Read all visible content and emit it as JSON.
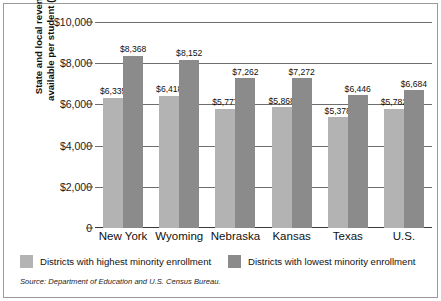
{
  "chart_data": {
    "type": "bar",
    "title": "",
    "xlabel": "",
    "ylabel": "State and local revenues available per student (2000)",
    "ylabel_line1": "State and local revenues",
    "ylabel_line2": "available per student (2000)",
    "ylim": [
      0,
      10000
    ],
    "ytick_labels": [
      "$10,000",
      "$8,000",
      "$6,000",
      "$4,000",
      "$2,000",
      "0"
    ],
    "ytick_values": [
      10000,
      8000,
      6000,
      4000,
      2000,
      0
    ],
    "grid": "horizontal",
    "legend_position": "bottom",
    "categories": [
      "New York",
      "Wyoming",
      "Nebraska",
      "Kansas",
      "Texas",
      "U.S."
    ],
    "series": [
      {
        "name": "Districts with highest minority enrollment",
        "color": "#b3b3b3",
        "values": [
          6335,
          6418,
          5777,
          5868,
          5378,
          5782
        ],
        "labels": [
          "$6,335",
          "$6,418",
          "$5,777",
          "$5,868",
          "$5,378",
          "$5,782"
        ]
      },
      {
        "name": "Districts with lowest minority enrollment",
        "color": "#8b8b8b",
        "values": [
          8368,
          8152,
          7262,
          7272,
          6446,
          6684
        ],
        "labels": [
          "$8,368",
          "$8,152",
          "$7,262",
          "$7,272",
          "$6,446",
          "$6,684"
        ]
      }
    ],
    "source_note": "Source: Department of Education and U.S. Census Bureau."
  }
}
